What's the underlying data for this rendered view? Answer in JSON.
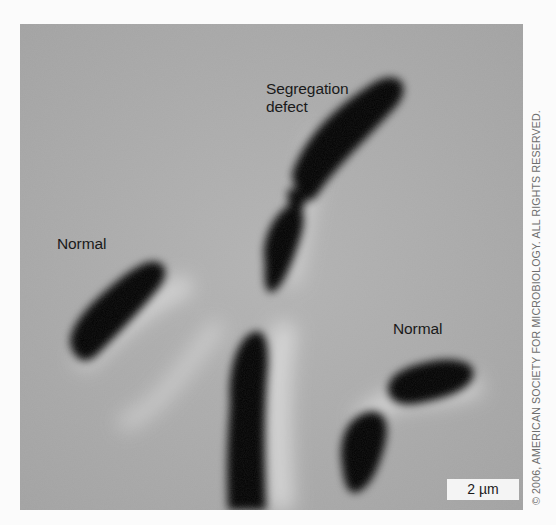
{
  "figure": {
    "labels": {
      "segregation_defect_line1": "Segregation",
      "segregation_defect_line2": "defect",
      "normal_left": "Normal",
      "normal_right": "Normal"
    },
    "scale_bar": "2 µm",
    "copyright": "© 2006, AMERICAN SOCIETY FOR MICROBIOLOGY. ALL RIGHTS RESERVED."
  },
  "colors": {
    "background": "#a9a9a9",
    "cell": "#050505",
    "halo": "#e6e6e6",
    "page": "#fbfbfb"
  }
}
